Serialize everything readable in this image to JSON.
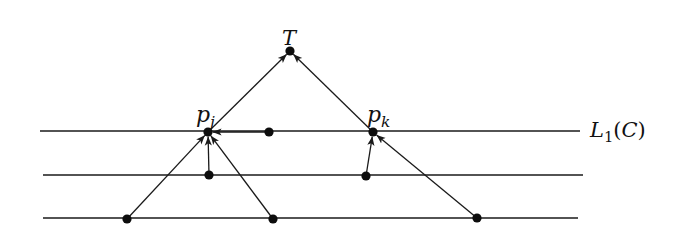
{
  "diagram": {
    "title": "",
    "colors": {
      "stroke": "#1a1a1a",
      "node": "#0d0d0d",
      "background": "#ffffff"
    },
    "horizontal_lines": [
      {
        "id": "line-1",
        "x1": 40,
        "x2": 580,
        "y": 131
      },
      {
        "id": "line-2",
        "x1": 43,
        "x2": 583,
        "y": 175
      },
      {
        "id": "line-3",
        "x1": 43,
        "x2": 578,
        "y": 218
      }
    ],
    "level_label": {
      "script": "L",
      "subscript": "1",
      "argument": "C",
      "text": "𝓛₁(𝓒)"
    },
    "nodes": [
      {
        "id": "T",
        "x": 290,
        "y": 51,
        "label": "T"
      },
      {
        "id": "pj",
        "x": 208,
        "y": 132,
        "label": "p",
        "subscript": "j"
      },
      {
        "id": "pk",
        "x": 373,
        "y": 132,
        "label": "p",
        "subscript": "k"
      },
      {
        "id": "a",
        "x": 269,
        "y": 132,
        "label": ""
      },
      {
        "id": "b",
        "x": 209,
        "y": 175,
        "label": ""
      },
      {
        "id": "c",
        "x": 366,
        "y": 176,
        "label": ""
      },
      {
        "id": "d",
        "x": 127,
        "y": 219,
        "label": ""
      },
      {
        "id": "e",
        "x": 273,
        "y": 219,
        "label": ""
      },
      {
        "id": "f",
        "x": 477,
        "y": 218,
        "label": ""
      }
    ],
    "edges": [
      {
        "from": "pj",
        "to": "T"
      },
      {
        "from": "pk",
        "to": "T"
      },
      {
        "from": "a",
        "to": "pj"
      },
      {
        "from": "b",
        "to": "pj"
      },
      {
        "from": "d",
        "to": "pj"
      },
      {
        "from": "e",
        "to": "pj"
      },
      {
        "from": "c",
        "to": "pk"
      },
      {
        "from": "f",
        "to": "pk"
      }
    ]
  }
}
